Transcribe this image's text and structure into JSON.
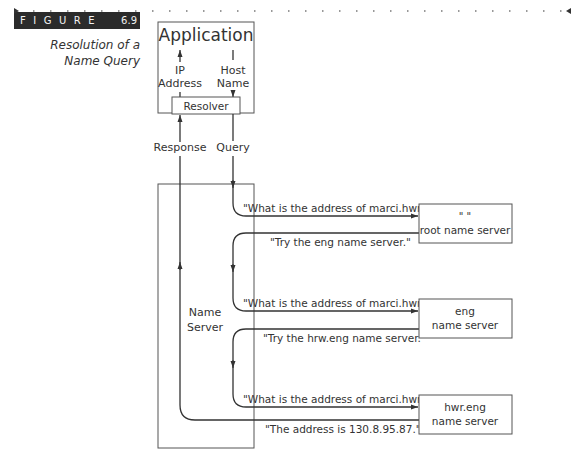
{
  "figure": {
    "tag_letters": "FIGURE",
    "number": "6.9",
    "caption_line1": "Resolution of a",
    "caption_line2": "Name Query"
  },
  "diagram": {
    "application_label": "Application",
    "ip_address_line1": "IP",
    "ip_address_line2": "Address",
    "host_name_line1": "Host",
    "host_name_line2": "Name",
    "resolver_label": "Resolver",
    "response_label": "Response",
    "query_label": "Query",
    "name_server_line1": "Name",
    "name_server_line2": "Server",
    "servers": [
      {
        "line1": "\" \"",
        "line2": "root name server"
      },
      {
        "line1": "eng",
        "line2": "name server"
      },
      {
        "line1": "hwr.eng",
        "line2": "name server"
      }
    ],
    "messages": [
      {
        "query": "\"What is the address of marci.hwr.eng?\"",
        "reply": "\"Try the eng name server.\""
      },
      {
        "query": "\"What is the address of marci.hwr.eng?\"",
        "reply": "\"Try the hrw.eng name server.\""
      },
      {
        "query": "\"What is the address of marci.hwr.eng?\"",
        "reply": "\"The address is 130.8.95.87.\""
      }
    ]
  },
  "colors": {
    "line": "#333333",
    "box": "#555555",
    "tag_bg": "#2b2b2b"
  }
}
